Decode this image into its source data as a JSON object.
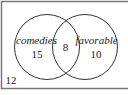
{
  "diagram": {
    "type": "venn",
    "universe": {
      "outside_value": "12"
    },
    "sets": [
      {
        "label": "comedies",
        "only_value": "15"
      },
      {
        "label": "favorable",
        "only_value": "10"
      }
    ],
    "intersection": {
      "value": "8"
    },
    "colors": {
      "stroke": "#333333",
      "border": "#777777",
      "text": "#222222",
      "background": "#ffffff"
    }
  }
}
